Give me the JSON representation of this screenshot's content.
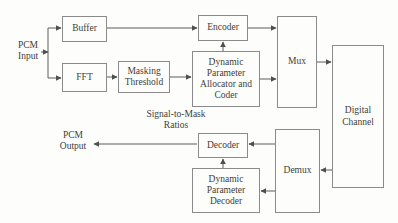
{
  "diagram": {
    "kind": "block-diagram"
  },
  "boxes": {
    "buffer": {
      "label": "Buffer"
    },
    "fft": {
      "label": "FFT"
    },
    "masking_threshold": {
      "label": "Masking\nThreshold"
    },
    "encoder": {
      "label": "Encoder"
    },
    "dynamic_parameter_allocator": {
      "label": "Dynamic\nParameter\nAllocator and\nCoder"
    },
    "mux": {
      "label": "Mux"
    },
    "digital_channel": {
      "label": "Digital\nChannel"
    },
    "decoder": {
      "label": "Decoder"
    },
    "dynamic_parameter_decoder": {
      "label": "Dynamic\nParameter\nDecoder"
    },
    "demux": {
      "label": "Demux"
    }
  },
  "labels": {
    "pcm_input": "PCM\nInput",
    "pcm_output": "PCM\nOutput",
    "signal_to_mask": "Signal-to-Mask\nRatios"
  },
  "colors": {
    "background": "#fdfdfc",
    "box_border": "#8b8b8b",
    "text": "#423e38",
    "connector": "#5c5c5c"
  },
  "connections": [
    {
      "from": "pcm-input",
      "to": "buffer"
    },
    {
      "from": "pcm-input",
      "to": "fft"
    },
    {
      "from": "buffer",
      "to": "encoder"
    },
    {
      "from": "fft",
      "to": "masking-threshold"
    },
    {
      "from": "masking-threshold",
      "to": "dynamic-parameter-allocator"
    },
    {
      "from": "dynamic-parameter-allocator",
      "to": "encoder"
    },
    {
      "from": "encoder",
      "to": "mux"
    },
    {
      "from": "dynamic-parameter-allocator",
      "to": "mux"
    },
    {
      "from": "mux",
      "to": "digital-channel"
    },
    {
      "from": "digital-channel",
      "to": "demux"
    },
    {
      "from": "demux",
      "to": "decoder"
    },
    {
      "from": "demux",
      "to": "dynamic-parameter-decoder"
    },
    {
      "from": "dynamic-parameter-decoder",
      "to": "decoder"
    },
    {
      "from": "decoder",
      "to": "pcm-output"
    }
  ]
}
